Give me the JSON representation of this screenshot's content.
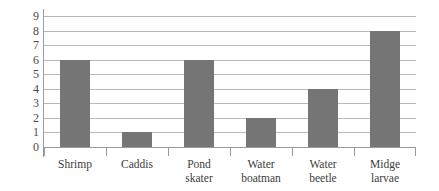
{
  "chart_data": {
    "type": "bar",
    "title": "",
    "subtitle": "",
    "xlabel": "",
    "ylabel": "",
    "categories": [
      "Shrimp",
      "Caddis",
      "Pond skater",
      "Water boatman",
      "Water beetle",
      "Midge larvae"
    ],
    "category_lines": [
      [
        "Shrimp",
        ""
      ],
      [
        "Caddis",
        ""
      ],
      [
        "Pond",
        "skater"
      ],
      [
        "Water",
        "boatman"
      ],
      [
        "Water",
        "beetle"
      ],
      [
        "Midge",
        "larvae"
      ]
    ],
    "values": [
      6,
      1,
      6,
      2,
      4,
      8
    ],
    "ylim": [
      0,
      9
    ],
    "ytick_labels": [
      "0",
      "1",
      "2",
      "3",
      "4",
      "5",
      "6",
      "7",
      "8",
      "9"
    ],
    "ytick_values": [
      0,
      1,
      2,
      3,
      4,
      5,
      6,
      7,
      8,
      9
    ],
    "grid": true,
    "grid_orientation": "horizontal",
    "legend": false,
    "legend_position": "none",
    "bar_color": "#757575",
    "gridline_color": "#b9b9b9",
    "axis_color": "#9a9a9a",
    "background_color": "#ffffff"
  }
}
